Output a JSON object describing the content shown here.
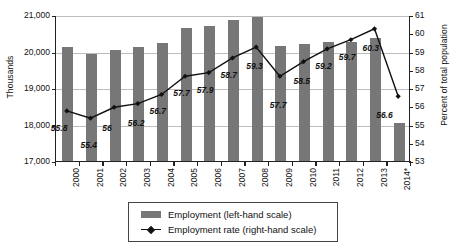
{
  "chart_data": {
    "type": "bar",
    "title": "",
    "subtitle": "",
    "xlabel": "",
    "ylabel": "Thousands",
    "ylabel_right": "Percent of total population",
    "categories": [
      "2000",
      "2001",
      "2002",
      "2003",
      "2004",
      "2005",
      "2006",
      "2007",
      "2008",
      "2009",
      "2010",
      "2011",
      "2012",
      "2013",
      "2014*"
    ],
    "ylim": [
      17000,
      21000
    ],
    "yticks": [
      "17,000",
      "18,000",
      "19,000",
      "20,000",
      "21,000"
    ],
    "ytick_values": [
      17000,
      18000,
      19000,
      20000,
      21000
    ],
    "ylim_right": [
      53,
      61
    ],
    "yticks_right": [
      "53",
      "54",
      "55",
      "56",
      "57",
      "58",
      "59",
      "60",
      "61"
    ],
    "ytick_values_right": [
      53,
      54,
      55,
      56,
      57,
      58,
      59,
      60,
      61
    ],
    "grid": true,
    "legend_position": "bottom",
    "series": [
      {
        "name": "Employment (left-hand scale)",
        "type": "bar",
        "axis": "left",
        "color": "#777777",
        "values": [
          20160,
          19970,
          20080,
          20140,
          20270,
          20680,
          20720,
          20900,
          20980,
          20180,
          20240,
          20300,
          20280,
          20390,
          18060
        ]
      },
      {
        "name": "Employment rate (right-hand scale)",
        "type": "line",
        "axis": "right",
        "color": "#111111",
        "values": [
          55.8,
          55.4,
          56,
          56.2,
          56.7,
          57.7,
          57.9,
          58.7,
          59.3,
          57.7,
          58.5,
          59.2,
          59.7,
          60.3,
          56.6
        ],
        "data_labels": [
          "55.8",
          "55.4",
          "56",
          "56.2",
          "56.7",
          "57.7",
          "57.9",
          "58.7",
          "59.3",
          "57.7",
          "58.5",
          "59.2",
          "59.7",
          "60.3",
          "56.6"
        ]
      }
    ]
  },
  "legend": {
    "items": [
      {
        "label": "Employment (left-hand scale)",
        "marker": "bar-swatch"
      },
      {
        "label": "Employment rate (right-hand scale)",
        "marker": "line-diamond-swatch"
      }
    ]
  }
}
